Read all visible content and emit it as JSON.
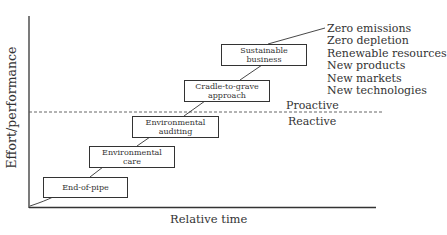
{
  "diagram": {
    "axes": {
      "y_label": "Effort/performance",
      "x_label": "Relative time"
    },
    "stages": [
      {
        "label": "End-of-pipe"
      },
      {
        "label": "Environmental care"
      },
      {
        "label": "Environmental auditing"
      },
      {
        "label": "Cradle-to-grave approach"
      },
      {
        "label": "Sustainable business"
      }
    ],
    "threshold": {
      "above_label": "Proactive",
      "below_label": "Reactive"
    },
    "outcomes": [
      "Zero emissions",
      "Zero depletion",
      "Renewable resources",
      "New products",
      "New markets",
      "New technologies"
    ]
  }
}
